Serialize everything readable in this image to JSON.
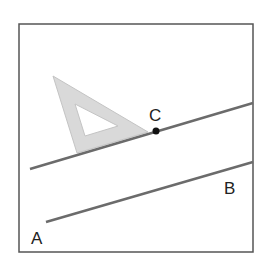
{
  "diagram": {
    "colors": {
      "frame": "#555555",
      "line": "#6b6b6b",
      "set_square_fill": "#d9d9d9",
      "set_square_stroke": "#c4c4c4",
      "point": "#111111",
      "label": "#222222"
    },
    "labels": {
      "A": "A",
      "B": "B",
      "C": "C"
    },
    "frame": {
      "x": 19,
      "y": 24,
      "width": 234,
      "height": 228
    },
    "line_ab": {
      "x1": 46,
      "y1": 222,
      "x2": 253,
      "y2": 162
    },
    "line_through_c": {
      "x1": 30,
      "y1": 169,
      "x2": 253,
      "y2": 103
    },
    "point_c": {
      "x": 156,
      "y": 131
    },
    "set_square": {
      "outer": "53,76 148,132 77,153",
      "inner": "75,104 118,126 85,136"
    }
  }
}
